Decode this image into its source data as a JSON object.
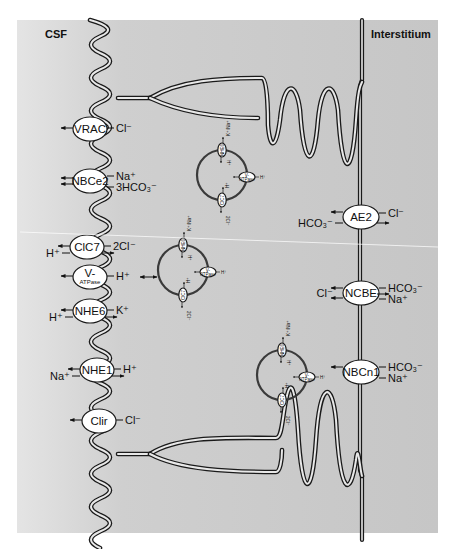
{
  "figure": {
    "regions": {
      "left": "CSF",
      "right": "Interstitium"
    },
    "colors": {
      "background": "#c9c9c9",
      "background_light": "#e2e2e2",
      "membrane": "#1a1a1a",
      "transporter_fill": "#ffffff",
      "vesicle_stroke": "#3a3a3a"
    },
    "apical_transporters": [
      {
        "id": "vrac",
        "name": "VRAC",
        "ions": [
          {
            "label": "Cl⁻",
            "side": "right",
            "dir": "out"
          }
        ]
      },
      {
        "id": "nbce2",
        "name": "NBCe2",
        "ions": [
          {
            "label": "Na⁺",
            "side": "right",
            "dir": "out"
          },
          {
            "label": "3HCO₃⁻",
            "side": "right",
            "dir": "out"
          }
        ]
      },
      {
        "id": "clc7",
        "name": "ClC7",
        "ions": [
          {
            "label": "2Cl⁻",
            "side": "right",
            "dir": "out"
          },
          {
            "label": "H⁺",
            "side": "left",
            "dir": "in"
          }
        ]
      },
      {
        "id": "vatpase",
        "name": "V-",
        "subname": "ATPase",
        "ions": [
          {
            "label": "H⁺",
            "side": "right",
            "dir": "out"
          }
        ]
      },
      {
        "id": "nhe6",
        "name": "NHE6",
        "ions": [
          {
            "label": "K⁺",
            "side": "right",
            "dir": "out"
          },
          {
            "label": "H⁺",
            "side": "left",
            "dir": "in"
          }
        ]
      },
      {
        "id": "nhe1",
        "name": "NHE1",
        "ions": [
          {
            "label": "H⁺",
            "side": "right",
            "dir": "out"
          },
          {
            "label": "Na⁺",
            "side": "left",
            "dir": "in"
          }
        ]
      },
      {
        "id": "clir",
        "name": "Clir",
        "ions": [
          {
            "label": "Cl⁻",
            "side": "right",
            "dir": "out"
          }
        ]
      }
    ],
    "basolateral_transporters": [
      {
        "id": "ae2",
        "name": "AE2",
        "ions": [
          {
            "label": "Cl⁻",
            "side": "right",
            "dir": "in"
          },
          {
            "label": "HCO₃⁻",
            "side": "left",
            "dir": "out"
          }
        ]
      },
      {
        "id": "ncbe",
        "name": "NCBE",
        "ions": [
          {
            "label": "Cl⁻",
            "side": "left",
            "dir": "out"
          },
          {
            "label": "HCO₃⁻",
            "side": "right",
            "dir": "in"
          },
          {
            "label": "Na⁺",
            "side": "right",
            "dir": "in"
          }
        ]
      },
      {
        "id": "nbcn1",
        "name": "NBCn1",
        "ions": [
          {
            "label": "HCO₃⁻",
            "side": "right",
            "dir": "in"
          },
          {
            "label": "Na⁺",
            "side": "right",
            "dir": "in"
          }
        ]
      }
    ],
    "vesicles": [
      {
        "id": "vesicle-1",
        "transporters": {
          "top": "NHE6",
          "right_a": "V-",
          "right_b": "ATPase",
          "bottom": "ClC7"
        },
        "ions": {
          "top_out": "K⁺/Na⁺",
          "top_in": "H⁺",
          "right": "H⁺",
          "bottom_in": "H⁺",
          "bottom_out": "2Cl⁻"
        }
      },
      {
        "id": "vesicle-2",
        "transporters": {
          "top": "NHE6",
          "right_a": "V-",
          "right_b": "ATPase",
          "bottom": "ClC7"
        },
        "ions": {
          "top_out": "K⁺/Na⁺",
          "top_in": "H⁺",
          "right": "H⁺",
          "bottom_in": "H⁺",
          "bottom_out": "2Cl⁻"
        }
      },
      {
        "id": "vesicle-3",
        "transporters": {
          "top": "NHE6",
          "right_a": "V-",
          "right_b": "ATPase",
          "bottom": "ClC7"
        },
        "ions": {
          "top_out": "K⁺/Na⁺",
          "top_in": "H⁺",
          "right": "H⁺",
          "bottom_in": "H⁺",
          "bottom_out": "2Cl⁻"
        }
      }
    ]
  }
}
